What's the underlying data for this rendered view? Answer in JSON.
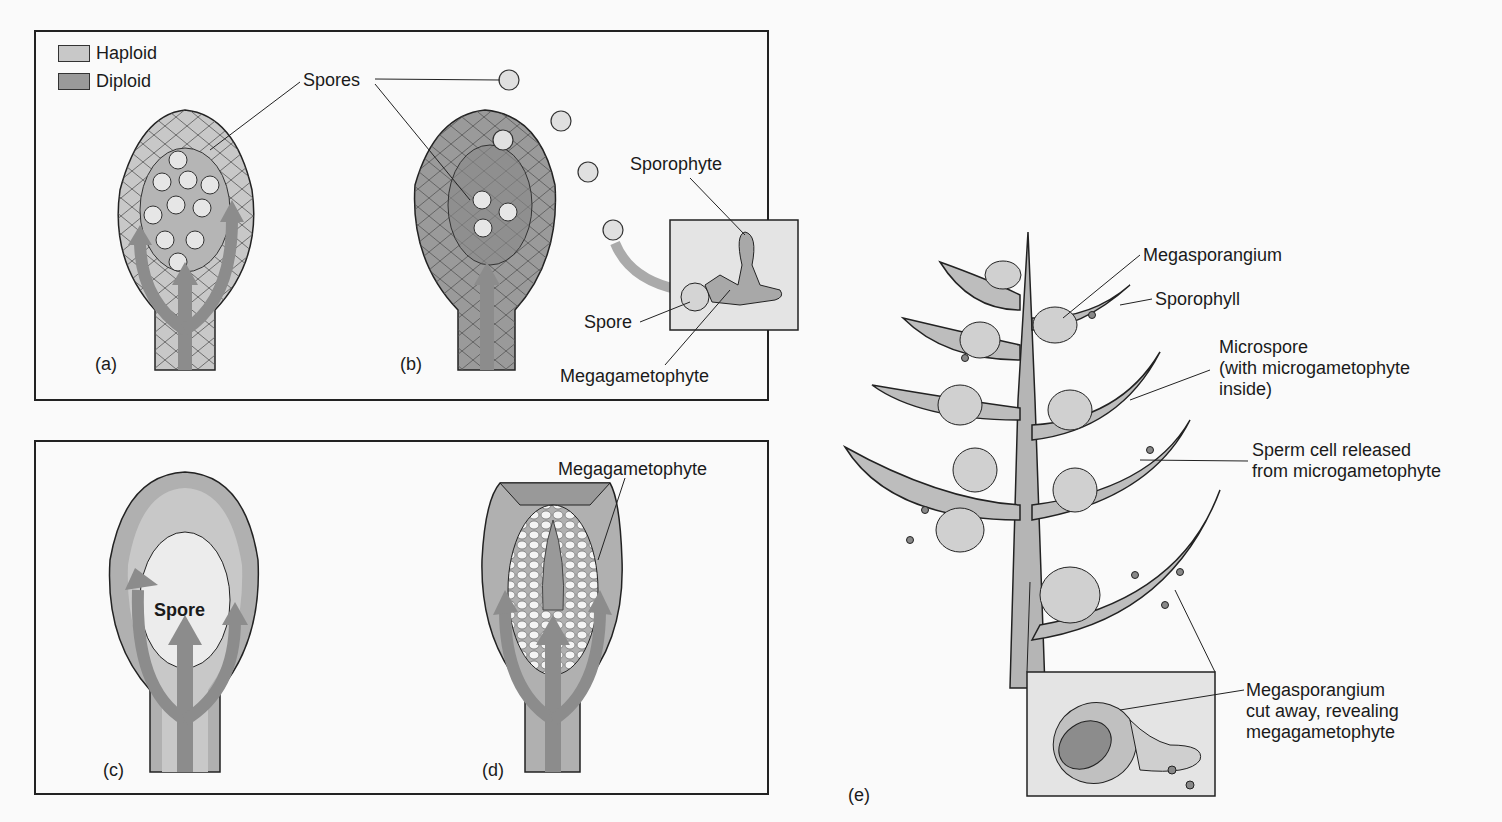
{
  "legend": {
    "items": [
      {
        "label": "Haploid",
        "color": "#c8c8c8"
      },
      {
        "label": "Diploid",
        "color": "#9a9a9a"
      }
    ]
  },
  "panel_top": {
    "labels": {
      "spores": "Spores",
      "sporophyte": "Sporophyte",
      "spore": "Spore",
      "megagametophyte": "Megagametophyte",
      "a": "(a)",
      "b": "(b)"
    }
  },
  "panel_bottom": {
    "labels": {
      "spore_inner": "Spore",
      "megagametophyte": "Megagametophyte",
      "c": "(c)",
      "d": "(d)"
    }
  },
  "panel_e": {
    "labels": {
      "megasporangium": "Megasporangium",
      "sporophyll": "Sporophyll",
      "microspore": "Microspore\n(with microgametophyte\ninside)",
      "sperm": "Sperm cell released\nfrom microgametophyte",
      "cutaway": "Megasporangium\ncut away, revealing\nmegagametophyte",
      "e": "(e)"
    }
  },
  "colors": {
    "haploid": "#c8c8c8",
    "diploid": "#9a9a9a",
    "arrow": "#8c8c8c",
    "line": "#222222"
  }
}
